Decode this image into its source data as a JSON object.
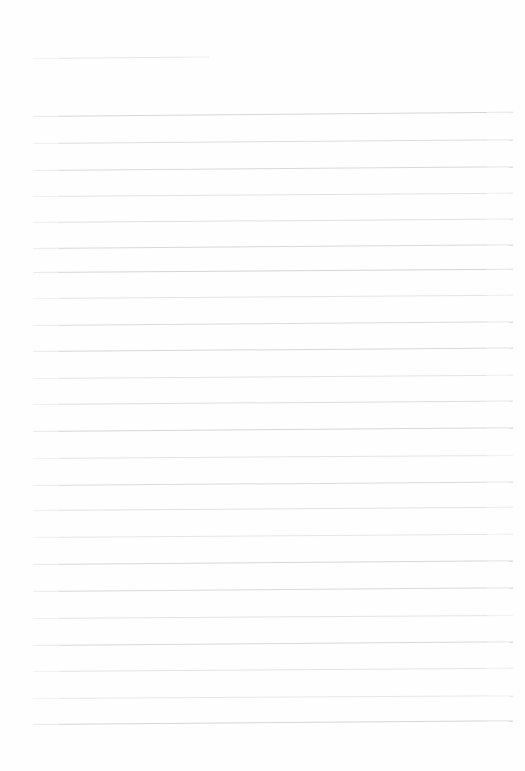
{
  "document": {
    "kind": "scanned-lined-paper",
    "title": "Blank Lined Paper",
    "page_width": 525,
    "page_height": 771,
    "background_color": "#ffffff",
    "paper_tint_color": "#fefefe",
    "handwritten_text": "",
    "typed_text": "",
    "margin_rule_present": false,
    "header_text": "",
    "footer_text": "",
    "page_number_text": ""
  },
  "ruling": {
    "line_count": 25,
    "left_x": 33,
    "right_x": 512,
    "default_line_color": "#dcdce0",
    "spacing_px": 26.8,
    "tilt_degrees": -0.42,
    "lines": [
      {
        "index": 1,
        "y": 58,
        "x_start": 33,
        "x_end": 209,
        "color": "#e2e2e6",
        "thickness": 1,
        "tilt": -0.45,
        "opacity": 0.85
      },
      {
        "index": 2,
        "y": 116,
        "x_start": 33,
        "x_end": 513,
        "color": "#d6d6da",
        "thickness": 1,
        "tilt": -0.5,
        "opacity": 1.0
      },
      {
        "index": 3,
        "y": 143,
        "x_start": 33,
        "x_end": 513,
        "color": "#dcdce0",
        "thickness": 1,
        "tilt": -0.45,
        "opacity": 0.95
      },
      {
        "index": 4,
        "y": 170,
        "x_start": 33,
        "x_end": 513,
        "color": "#d9d9dd",
        "thickness": 1,
        "tilt": -0.46,
        "opacity": 1.0
      },
      {
        "index": 5,
        "y": 196,
        "x_start": 33,
        "x_end": 513,
        "color": "#e0e0e4",
        "thickness": 1,
        "tilt": -0.38,
        "opacity": 0.9
      },
      {
        "index": 6,
        "y": 222,
        "x_start": 33,
        "x_end": 513,
        "color": "#dedee2",
        "thickness": 1,
        "tilt": -0.42,
        "opacity": 0.92
      },
      {
        "index": 7,
        "y": 248,
        "x_start": 33,
        "x_end": 513,
        "color": "#d8d8dc",
        "thickness": 1,
        "tilt": -0.44,
        "opacity": 1.0
      },
      {
        "index": 8,
        "y": 272,
        "x_start": 33,
        "x_end": 513,
        "color": "#d5d5d9",
        "thickness": 1,
        "tilt": -0.4,
        "opacity": 1.0
      },
      {
        "index": 9,
        "y": 298,
        "x_start": 33,
        "x_end": 513,
        "color": "#e1e1e5",
        "thickness": 1,
        "tilt": -0.4,
        "opacity": 0.88
      },
      {
        "index": 10,
        "y": 325,
        "x_start": 33,
        "x_end": 513,
        "color": "#dadade",
        "thickness": 1,
        "tilt": -0.44,
        "opacity": 0.96
      },
      {
        "index": 11,
        "y": 351,
        "x_start": 33,
        "x_end": 513,
        "color": "#d7d7db",
        "thickness": 1,
        "tilt": -0.42,
        "opacity": 1.0
      },
      {
        "index": 12,
        "y": 378,
        "x_start": 33,
        "x_end": 513,
        "color": "#e0e0e4",
        "thickness": 1,
        "tilt": -0.38,
        "opacity": 0.88
      },
      {
        "index": 13,
        "y": 404,
        "x_start": 33,
        "x_end": 513,
        "color": "#dddde1",
        "thickness": 1,
        "tilt": -0.42,
        "opacity": 0.94
      },
      {
        "index": 14,
        "y": 431,
        "x_start": 33,
        "x_end": 513,
        "color": "#d6d6da",
        "thickness": 1,
        "tilt": -0.44,
        "opacity": 1.0
      },
      {
        "index": 15,
        "y": 458,
        "x_start": 33,
        "x_end": 513,
        "color": "#e1e1e5",
        "thickness": 1,
        "tilt": -0.36,
        "opacity": 0.88
      },
      {
        "index": 16,
        "y": 485,
        "x_start": 33,
        "x_end": 513,
        "color": "#dadade",
        "thickness": 1,
        "tilt": -0.42,
        "opacity": 0.96
      },
      {
        "index": 17,
        "y": 510,
        "x_start": 33,
        "x_end": 513,
        "color": "#dfdfe3",
        "thickness": 1,
        "tilt": -0.4,
        "opacity": 0.9
      },
      {
        "index": 18,
        "y": 537,
        "x_start": 33,
        "x_end": 513,
        "color": "#e2e2e6",
        "thickness": 1,
        "tilt": -0.38,
        "opacity": 0.86
      },
      {
        "index": 19,
        "y": 564,
        "x_start": 33,
        "x_end": 513,
        "color": "#d7d7db",
        "thickness": 1,
        "tilt": -0.44,
        "opacity": 1.0
      },
      {
        "index": 20,
        "y": 591,
        "x_start": 33,
        "x_end": 513,
        "color": "#d9d9dd",
        "thickness": 1,
        "tilt": -0.46,
        "opacity": 1.0
      },
      {
        "index": 21,
        "y": 618,
        "x_start": 33,
        "x_end": 513,
        "color": "#e0e0e4",
        "thickness": 1,
        "tilt": -0.36,
        "opacity": 0.88
      },
      {
        "index": 22,
        "y": 645,
        "x_start": 33,
        "x_end": 513,
        "color": "#d8d8dc",
        "thickness": 1,
        "tilt": -0.44,
        "opacity": 1.0
      },
      {
        "index": 23,
        "y": 671,
        "x_start": 33,
        "x_end": 513,
        "color": "#e1e1e5",
        "thickness": 1,
        "tilt": -0.38,
        "opacity": 0.88
      },
      {
        "index": 24,
        "y": 698,
        "x_start": 33,
        "x_end": 513,
        "color": "#e3e3e7",
        "thickness": 1,
        "tilt": -0.34,
        "opacity": 0.84
      },
      {
        "index": 25,
        "y": 724,
        "x_start": 33,
        "x_end": 513,
        "color": "#d6d6da",
        "thickness": 1,
        "tilt": -0.44,
        "opacity": 1.0
      }
    ]
  }
}
